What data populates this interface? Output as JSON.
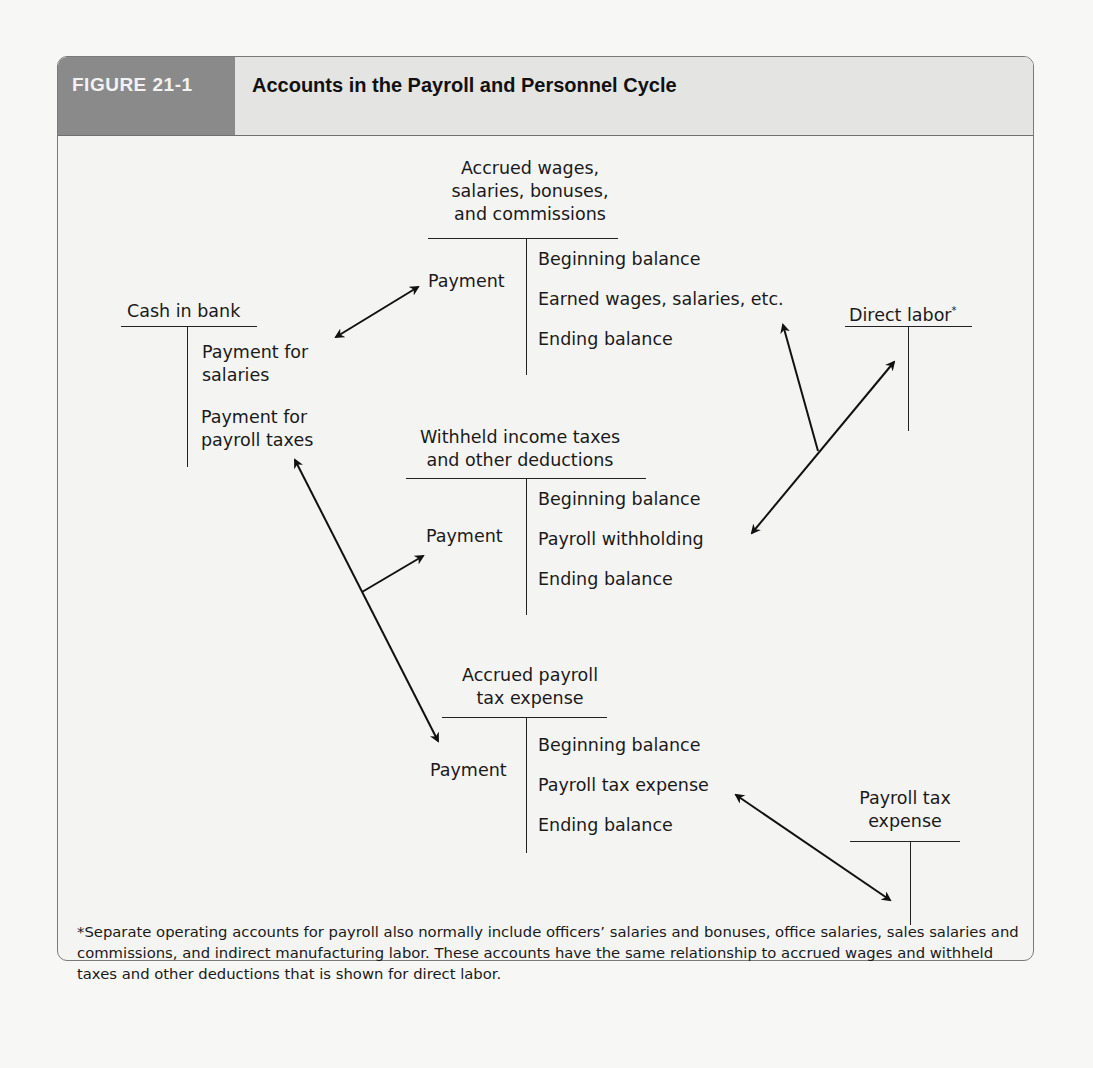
{
  "figure": {
    "label": "FIGURE 21-1",
    "title": "Accounts in the Payroll and Personnel Cycle",
    "colors": {
      "label_bg": "#8a8a8a",
      "header_bg": "#e4e4e3",
      "panel_bg": "#f4f4f3",
      "line": "#222222"
    }
  },
  "accounts": {
    "cash_in_bank": {
      "title": "Cash in bank",
      "debit": [],
      "credit": [
        "Payment for salaries",
        "Payment for payroll taxes"
      ],
      "credit_lines": [
        "Payment for",
        "salaries",
        "Payment for",
        "payroll taxes"
      ]
    },
    "accrued_wages": {
      "title_lines": [
        "Accrued wages,",
        "salaries, bonuses,",
        "and commissions"
      ],
      "debit": [
        "Payment"
      ],
      "credit": [
        "Beginning balance",
        "Earned wages, salaries, etc.",
        "Ending balance"
      ]
    },
    "direct_labor": {
      "title": "Direct labor",
      "footnote_marker": "*",
      "debit": [],
      "credit": []
    },
    "withheld_taxes": {
      "title_lines": [
        "Withheld income taxes",
        "and other deductions"
      ],
      "debit": [
        "Payment"
      ],
      "credit": [
        "Beginning balance",
        "Payroll withholding",
        "Ending balance"
      ]
    },
    "accrued_payroll_tax": {
      "title_lines": [
        "Accrued payroll",
        "tax expense"
      ],
      "debit": [
        "Payment"
      ],
      "credit": [
        "Beginning balance",
        "Payroll tax expense",
        "Ending balance"
      ]
    },
    "payroll_tax_expense": {
      "title_lines": [
        "Payroll tax",
        "expense"
      ],
      "debit": [],
      "credit": []
    }
  },
  "arrows": [
    {
      "from": "Cash in bank: Payment for salaries",
      "to": "Accrued wages: Payment",
      "type": "double"
    },
    {
      "from": "Cash in bank: Payment for payroll taxes",
      "to": "Accrued payroll tax expense: Payment",
      "type": "double",
      "branch_to": "Withheld income taxes: Payment"
    },
    {
      "from": "Withheld income taxes: Payroll withholding",
      "to": "Direct labor",
      "type": "double",
      "branch_to": "Accrued wages: Earned wages, salaries, etc."
    },
    {
      "from": "Accrued payroll tax expense: Payroll tax expense",
      "to": "Payroll tax expense",
      "type": "double"
    }
  ],
  "footnote": "*Separate operating accounts for payroll also normally include officers’ salaries and bonuses, office salaries, sales salaries and commissions, and indirect manufacturing labor. These accounts have the same relationship to accrued wages and withheld taxes and other deductions that is shown for direct labor."
}
